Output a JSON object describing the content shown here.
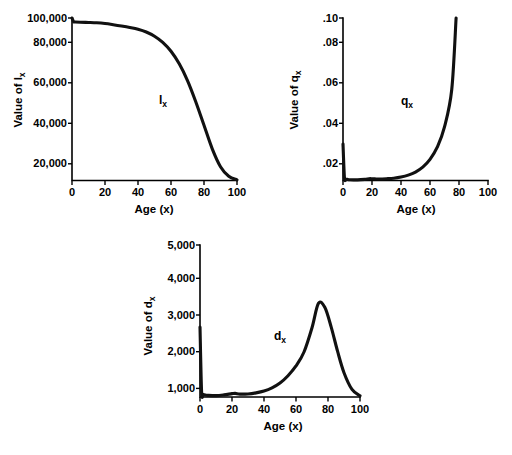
{
  "figure": {
    "title": "",
    "background": "#ffffff",
    "ink_color": "#111111",
    "panel_count": 3
  },
  "panels": {
    "lx": {
      "name": "lx-panel",
      "ylabel_prefix": "Value of ",
      "ylabel_symbol": "l",
      "ylabel_sub": "x",
      "xlabel": "Age (x)",
      "curve_label_symbol": "l",
      "curve_label_sub": "x",
      "yticks": [
        "20,000",
        "40,000",
        "60,000",
        "80,000",
        "100,000"
      ],
      "xticks": [
        "0",
        "20",
        "40",
        "60",
        "80",
        "100"
      ]
    },
    "qx": {
      "name": "qx-panel",
      "ylabel_prefix": "Value of ",
      "ylabel_symbol": "q",
      "ylabel_sub": "x",
      "xlabel": "Age (x)",
      "curve_label_symbol": "q",
      "curve_label_sub": "x",
      "yticks": [
        ".02",
        ".04",
        ".06",
        ".08",
        ".10"
      ],
      "xticks": [
        "0",
        "20",
        "40",
        "60",
        "80",
        "100"
      ]
    },
    "dx": {
      "name": "dx-panel",
      "ylabel_prefix": "Value of ",
      "ylabel_symbol": "d",
      "ylabel_sub": "x",
      "xlabel": "Age (x)",
      "curve_label_symbol": "d",
      "curve_label_sub": "x",
      "yticks": [
        "1,000",
        "2,000",
        "3,000",
        "4,000",
        "5,000"
      ],
      "xticks": [
        "0",
        "20",
        "40",
        "60",
        "80",
        "100"
      ]
    }
  },
  "chart_data": [
    {
      "type": "line",
      "id": "lx",
      "title": "",
      "xlabel": "Age (x)",
      "ylabel": "Value of lx",
      "series_name": "lx",
      "xlim": [
        0,
        100
      ],
      "ylim": [
        0,
        100000
      ],
      "xticks": [
        0,
        20,
        40,
        60,
        80,
        100
      ],
      "yticks": [
        20000,
        40000,
        60000,
        80000,
        100000
      ],
      "grid": false,
      "legend": "none",
      "annotation": "lx",
      "x": [
        0,
        1,
        2,
        5,
        10,
        15,
        20,
        25,
        30,
        35,
        40,
        45,
        50,
        55,
        60,
        65,
        70,
        75,
        80,
        85,
        90,
        95,
        100
      ],
      "y": [
        100000,
        97700,
        97550,
        97400,
        97250,
        97050,
        96600,
        95900,
        95100,
        94200,
        93100,
        91400,
        88800,
        85000,
        79500,
        71800,
        61500,
        48500,
        34000,
        19500,
        8500,
        2600,
        400
      ]
    },
    {
      "type": "line",
      "id": "qx",
      "title": "",
      "xlabel": "Age (x)",
      "ylabel": "Value of qx",
      "series_name": "qx",
      "xlim": [
        0,
        100
      ],
      "ylim": [
        0,
        0.1
      ],
      "xticks": [
        0,
        20,
        40,
        60,
        80,
        100
      ],
      "yticks": [
        0.02,
        0.04,
        0.06,
        0.08,
        0.1
      ],
      "grid": false,
      "legend": "none",
      "annotation": "qx",
      "x": [
        0,
        1,
        2,
        3,
        5,
        10,
        15,
        18,
        20,
        22,
        25,
        30,
        35,
        40,
        45,
        50,
        55,
        60,
        65,
        70,
        75,
        78
      ],
      "y": [
        0.0225,
        0.0017,
        0.0009,
        0.0007,
        0.0005,
        0.0004,
        0.0007,
        0.0011,
        0.0011,
        0.001,
        0.0009,
        0.0011,
        0.0014,
        0.0021,
        0.0033,
        0.0052,
        0.0082,
        0.013,
        0.0205,
        0.033,
        0.056,
        0.1
      ]
    },
    {
      "type": "line",
      "id": "dx",
      "title": "",
      "xlabel": "Age (x)",
      "ylabel": "Value of dx",
      "series_name": "dx",
      "xlim": [
        0,
        100
      ],
      "ylim": [
        0,
        5000
      ],
      "xticks": [
        0,
        20,
        40,
        60,
        80,
        100
      ],
      "yticks": [
        1000,
        2000,
        3000,
        4000,
        5000
      ],
      "grid": false,
      "legend": "none",
      "annotation": "dx",
      "x": [
        0,
        1,
        2,
        3,
        5,
        10,
        15,
        20,
        22,
        25,
        30,
        35,
        40,
        45,
        50,
        55,
        60,
        65,
        70,
        74,
        78,
        82,
        86,
        90,
        95,
        100
      ],
      "y": [
        2300,
        170,
        90,
        70,
        55,
        45,
        70,
        110,
        120,
        95,
        100,
        135,
        195,
        300,
        460,
        700,
        1020,
        1480,
        2280,
        3080,
        2950,
        2300,
        1500,
        800,
        250,
        40
      ]
    }
  ]
}
